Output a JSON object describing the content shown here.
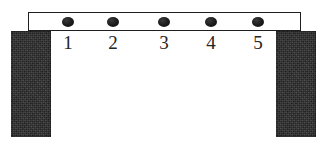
{
  "figure": {
    "background_color": "#ffffff",
    "width": 326,
    "height": 145
  },
  "beam": {
    "fill_color": "#ffffff",
    "border_color": "#1f1f1f",
    "x": 28,
    "y": 12,
    "width": 273,
    "height": 19
  },
  "supports": [
    {
      "name": "left-support",
      "color": "#2b2b2b",
      "x": 11,
      "y": 31,
      "width": 40,
      "height": 106
    },
    {
      "name": "right-support",
      "color": "#2b2b2b",
      "x": 276,
      "y": 31,
      "width": 40,
      "height": 106
    }
  ],
  "markers": [
    {
      "label": "1",
      "x": 68,
      "y": 22,
      "color": "#1a1a1a"
    },
    {
      "label": "2",
      "x": 113,
      "y": 22,
      "color": "#1a1a1a"
    },
    {
      "label": "3",
      "x": 164,
      "y": 22,
      "color": "#1a1a1a"
    },
    {
      "label": "4",
      "x": 211,
      "y": 22,
      "color": "#1a1a1a"
    },
    {
      "label": "5",
      "x": 258,
      "y": 22,
      "color": "#1a1a1a"
    }
  ]
}
